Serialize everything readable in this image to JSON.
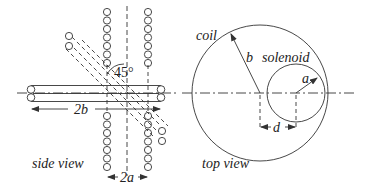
{
  "figure": {
    "side_view": {
      "caption": "side view",
      "angle_label": "45°",
      "coil_width_label": "2b",
      "solenoid_width_label": "2a",
      "solenoid_turns_per_stack": 7
    },
    "top_view": {
      "caption": "top view",
      "coil_label": "coil",
      "solenoid_label": "solenoid",
      "coil_radius_label": "b",
      "solenoid_radius_label": "a",
      "offset_label": "d"
    },
    "colors": {
      "line": "#333333",
      "background": "#ffffff"
    }
  }
}
